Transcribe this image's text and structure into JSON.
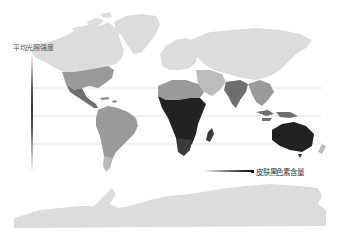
{
  "legend": {
    "vertical_label": "平均光照强度",
    "horizontal_label": "皮肤黑色素含量"
  },
  "colors": {
    "background": "#ffffff",
    "land_light": "#dcdcdc",
    "land_mid_light": "#bcbcbc",
    "land_mid": "#9a9a9a",
    "land_mid_dark": "#6e6e6e",
    "land_dark": "#3a3a3a",
    "land_darkest": "#222222",
    "reference_line": "#d8d8d8"
  },
  "regions": [
    {
      "name": "north-america-north",
      "shade": "land_light"
    },
    {
      "name": "greenland",
      "shade": "land_light"
    },
    {
      "name": "north-america-south",
      "shade": "land_mid"
    },
    {
      "name": "mexico",
      "shade": "land_mid_dark"
    },
    {
      "name": "south-america",
      "shade": "land_mid"
    },
    {
      "name": "south-america-south",
      "shade": "land_mid_light"
    },
    {
      "name": "europe",
      "shade": "land_light"
    },
    {
      "name": "russia-north-asia",
      "shade": "land_light"
    },
    {
      "name": "north-africa",
      "shade": "land_mid"
    },
    {
      "name": "central-africa",
      "shade": "land_darkest"
    },
    {
      "name": "southern-africa",
      "shade": "land_dark"
    },
    {
      "name": "madagascar",
      "shade": "land_dark"
    },
    {
      "name": "middle-east",
      "shade": "land_mid_light"
    },
    {
      "name": "india",
      "shade": "land_mid_dark"
    },
    {
      "name": "southeast-asia",
      "shade": "land_mid"
    },
    {
      "name": "indonesia-png",
      "shade": "land_mid_dark"
    },
    {
      "name": "australia",
      "shade": "land_darkest"
    },
    {
      "name": "new-zealand",
      "shade": "land_mid_light"
    },
    {
      "name": "antarctica",
      "shade": "land_light"
    }
  ]
}
